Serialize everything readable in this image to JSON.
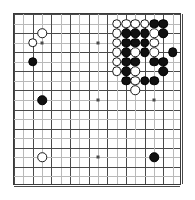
{
  "board": {
    "name": "go-board",
    "size": 19,
    "grid_color": "#4a4a4a",
    "border_color": "#3a3a3a",
    "background_color": "#ffffff",
    "black_color": "#111111",
    "white_color": "#ffffff",
    "star_points": [
      {
        "col": 3,
        "row": 3
      },
      {
        "col": 9,
        "row": 3
      },
      {
        "col": 15,
        "row": 3
      },
      {
        "col": 3,
        "row": 9
      },
      {
        "col": 9,
        "row": 9
      },
      {
        "col": 15,
        "row": 9
      },
      {
        "col": 3,
        "row": 15
      },
      {
        "col": 9,
        "row": 15
      },
      {
        "col": 15,
        "row": 15
      }
    ],
    "stones": [
      {
        "color": "w",
        "col": 3,
        "row": 2
      },
      {
        "color": "w",
        "col": 2,
        "row": 3
      },
      {
        "color": "b",
        "col": 2,
        "row": 5
      },
      {
        "color": "b",
        "col": 3,
        "row": 9
      },
      {
        "color": "w",
        "col": 3,
        "row": 15
      },
      {
        "color": "b",
        "col": 15,
        "row": 15
      },
      {
        "color": "w",
        "col": 11,
        "row": 1
      },
      {
        "color": "w",
        "col": 12,
        "row": 1
      },
      {
        "color": "w",
        "col": 13,
        "row": 1
      },
      {
        "color": "w",
        "col": 14,
        "row": 1
      },
      {
        "color": "b",
        "col": 15,
        "row": 1
      },
      {
        "color": "b",
        "col": 16,
        "row": 1
      },
      {
        "color": "w",
        "col": 11,
        "row": 2
      },
      {
        "color": "b",
        "col": 12,
        "row": 2
      },
      {
        "color": "b",
        "col": 13,
        "row": 2
      },
      {
        "color": "b",
        "col": 14,
        "row": 2
      },
      {
        "color": "w",
        "col": 15,
        "row": 2
      },
      {
        "color": "b",
        "col": 16,
        "row": 2
      },
      {
        "color": "w",
        "col": 11,
        "row": 3
      },
      {
        "color": "b",
        "col": 12,
        "row": 3
      },
      {
        "color": "b",
        "col": 13,
        "row": 3
      },
      {
        "color": "b",
        "col": 14,
        "row": 3
      },
      {
        "color": "w",
        "col": 15,
        "row": 3
      },
      {
        "color": "w",
        "col": 11,
        "row": 4
      },
      {
        "color": "b",
        "col": 12,
        "row": 4
      },
      {
        "color": "w",
        "col": 13,
        "row": 4
      },
      {
        "color": "b",
        "col": 14,
        "row": 4
      },
      {
        "color": "w",
        "col": 15,
        "row": 4
      },
      {
        "color": "b",
        "col": 17,
        "row": 4
      },
      {
        "color": "w",
        "col": 11,
        "row": 5
      },
      {
        "color": "b",
        "col": 12,
        "row": 5
      },
      {
        "color": "b",
        "col": 13,
        "row": 5
      },
      {
        "color": "b",
        "col": 15,
        "row": 5
      },
      {
        "color": "b",
        "col": 16,
        "row": 5
      },
      {
        "color": "w",
        "col": 11,
        "row": 6
      },
      {
        "color": "b",
        "col": 12,
        "row": 6
      },
      {
        "color": "w",
        "col": 13,
        "row": 6
      },
      {
        "color": "b",
        "col": 16,
        "row": 6
      },
      {
        "color": "b",
        "col": 12,
        "row": 7
      },
      {
        "color": "w",
        "col": 13,
        "row": 7
      },
      {
        "color": "b",
        "col": 14,
        "row": 7
      },
      {
        "color": "b",
        "col": 15,
        "row": 7
      },
      {
        "color": "w",
        "col": 13,
        "row": 8
      }
    ]
  }
}
